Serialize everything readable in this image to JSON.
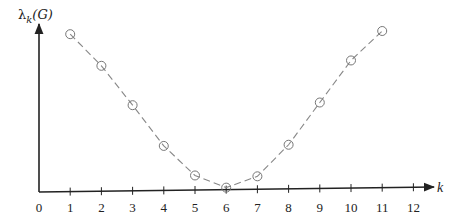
{
  "chart_data": {
    "type": "line",
    "title": "",
    "xlabel": "k",
    "ylabel": "λ_k(G)",
    "ylabel_parts": {
      "symbol": "λ",
      "subscript": "k",
      "arg": "(G)"
    },
    "x_ticks": [
      0,
      1,
      2,
      3,
      4,
      5,
      6,
      7,
      8,
      9,
      10,
      11,
      12
    ],
    "xlim": [
      0,
      12
    ],
    "y_ticks": [],
    "grid": false,
    "legend": null,
    "series": [
      {
        "name": "λ_k(G)",
        "style": "dashed line with open circle markers",
        "color": "#888888",
        "x": [
          1,
          2,
          3,
          4,
          5,
          6,
          7,
          8,
          9,
          10,
          11
        ],
        "values": [
          0.98,
          0.78,
          0.53,
          0.27,
          0.08,
          0.0,
          0.07,
          0.27,
          0.54,
          0.81,
          1.0
        ]
      }
    ]
  }
}
